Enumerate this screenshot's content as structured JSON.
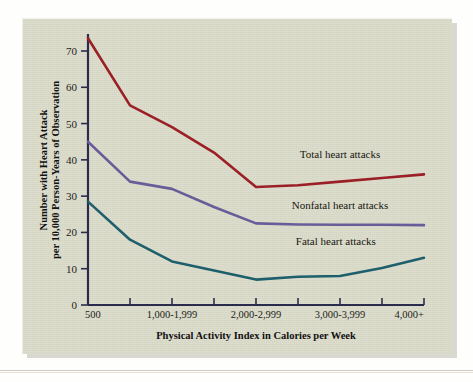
{
  "figure": {
    "panel_background": "#dcdccb",
    "page_background": "#fefefd",
    "axis_color": "#2b2b4e"
  },
  "chart_data": {
    "type": "line",
    "title": "",
    "xlabel": "Physical Activity Index in Calories per Week",
    "ylabel": "Number with Heart Attack per 10,000 Person-Years of Observation",
    "ylabel_line1": "Number with Heart Attack",
    "ylabel_line2": "per 10,000 Person-Years of Observation",
    "x": [
      0,
      1,
      2,
      3,
      4,
      5,
      6,
      7,
      8
    ],
    "categories": [
      "500",
      "",
      "1,000-1,999",
      "",
      "2,000-2,999",
      "",
      "3,000-3,999",
      "",
      "4,000+"
    ],
    "xtick_labels": [
      "500",
      "1,000-1,999",
      "2,000-2,999",
      "3,000-3,999",
      "4,000+"
    ],
    "xtick_label_positions": [
      0,
      2,
      4,
      6,
      8
    ],
    "ytick_labels": [
      "0",
      "10",
      "20",
      "30",
      "40",
      "50",
      "60",
      "70"
    ],
    "ylim": [
      0,
      74
    ],
    "yticks": [
      0,
      10,
      20,
      30,
      40,
      50,
      60,
      70
    ],
    "grid": false,
    "legend_position": "inline-right",
    "series": [
      {
        "name": "Total heart attacks",
        "label": "Total heart attacks",
        "color": "#9b2026",
        "values": [
          73.5,
          55.0,
          49.0,
          42.0,
          32.5,
          33.0,
          34.0,
          35.0,
          36.0
        ]
      },
      {
        "name": "Nonfatal heart attacks",
        "label": "Nonfatal heart attacks",
        "color": "#6a5c99",
        "values": [
          45.0,
          34.0,
          32.0,
          27.0,
          22.5,
          22.2,
          22.1,
          22.1,
          22.0
        ]
      },
      {
        "name": "Fatal heart attacks",
        "label": "Fatal heart attacks",
        "color": "#1d5f6b",
        "values": [
          28.5,
          18.0,
          12.0,
          9.5,
          7.0,
          7.8,
          8.0,
          10.2,
          13.0
        ]
      }
    ],
    "annotations": [
      {
        "text": "Total heart attacks",
        "x": 6.0,
        "y": 40.5
      },
      {
        "text": "Nonfatal heart attacks",
        "x": 6.0,
        "y": 26.5
      },
      {
        "text": "Fatal heart attacks",
        "x": 5.9,
        "y": 16.5
      }
    ]
  }
}
